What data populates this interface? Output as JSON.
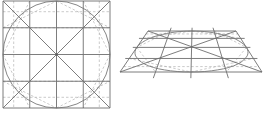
{
  "figure": {
    "panels": [
      {
        "name": "flat-square-grid",
        "grid_divisions": 4,
        "has_inscribed_circle": true,
        "has_diagonals": true
      },
      {
        "name": "perspective-trapezoid-grid",
        "grid_divisions": 4,
        "has_inscribed_ellipse": true,
        "has_diagonals": true
      }
    ],
    "colors": {
      "line": "#6e6e6e",
      "dashed": "#b4b4b4",
      "background": "#ffffff"
    }
  }
}
